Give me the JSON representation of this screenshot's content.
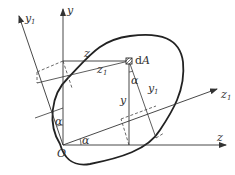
{
  "diagram": {
    "title": "",
    "labels": {
      "y": "y",
      "y1_base": "y",
      "y1_sub": "1",
      "z": "z",
      "z1_base": "z",
      "z1_sub": "1",
      "origin": "O",
      "area_element_d": "d",
      "area_element_A": "A",
      "z_dim": "z",
      "z1_dim_base": "z",
      "z1_dim_sub": "1",
      "y_dim": "y",
      "y1_dim_base": "y",
      "y1_dim_sub": "1",
      "alpha_near_dA": "α",
      "alpha_on_y_axis": "α",
      "alpha_on_z_axis": "α"
    },
    "colors": {
      "line": "#333333",
      "dashed": "#444444",
      "background": "#ffffff"
    }
  }
}
